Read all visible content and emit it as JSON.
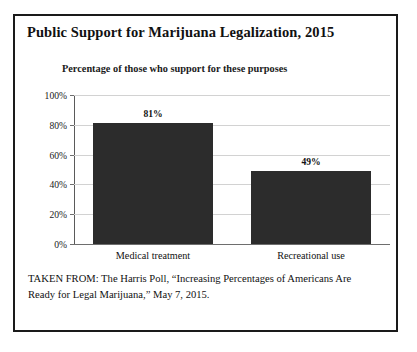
{
  "figure": {
    "title": "Public Support for Marijuana Legalization, 2015",
    "source_note": "TAKEN FROM: The Harris Poll, “Increasing Percentages of Americans Are Ready for Legal Marijuana,” May 7, 2015.",
    "border_color": "#1a1a1a",
    "background_color": "#ffffff"
  },
  "chart_data": {
    "type": "bar",
    "title": "Percentage of those who support for these purposes",
    "categories": [
      "Medical treatment",
      "Recreational use"
    ],
    "values": [
      81,
      49
    ],
    "value_labels": [
      "81%",
      "49%"
    ],
    "xlabel": "",
    "ylabel": "",
    "ylim": [
      0,
      100
    ],
    "yticks": [
      0,
      20,
      40,
      60,
      80,
      100
    ],
    "ytick_labels": [
      "0%",
      "20%",
      "40%",
      "60%",
      "80%",
      "100%"
    ],
    "grid": true,
    "grid_axis": "y",
    "legend": false,
    "bar_color": "#2c2c2c",
    "grid_color": "#d2d2d2",
    "axis_color": "#5a5a5a"
  }
}
